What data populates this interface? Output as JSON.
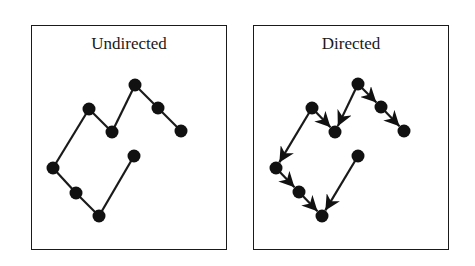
{
  "panels": [
    {
      "title": "Undirected",
      "directed": false,
      "nodes": [
        [
          53,
          168
        ],
        [
          76,
          193
        ],
        [
          99,
          216
        ],
        [
          134,
          156
        ],
        [
          89,
          109
        ],
        [
          112,
          132
        ],
        [
          135,
          85
        ],
        [
          158,
          108
        ],
        [
          181,
          131
        ]
      ],
      "edges": [
        [
          0,
          1
        ],
        [
          1,
          2
        ],
        [
          2,
          3
        ],
        [
          0,
          4
        ],
        [
          4,
          5
        ],
        [
          5,
          6
        ],
        [
          6,
          7
        ],
        [
          7,
          8
        ]
      ]
    },
    {
      "title": "Directed",
      "directed": true,
      "nodes": [
        [
          276,
          168
        ],
        [
          299,
          192
        ],
        [
          322,
          216
        ],
        [
          358,
          156
        ],
        [
          312,
          108
        ],
        [
          335,
          132
        ],
        [
          358,
          84
        ],
        [
          381,
          107
        ],
        [
          404,
          131
        ]
      ],
      "edges": [
        [
          0,
          1
        ],
        [
          1,
          2
        ],
        [
          3,
          2
        ],
        [
          4,
          0
        ],
        [
          4,
          5
        ],
        [
          6,
          5
        ],
        [
          6,
          7
        ],
        [
          7,
          8
        ]
      ]
    }
  ],
  "style": {
    "stroke": "#1a1a1a",
    "node_fill": "#111111",
    "node_radius": 6.5
  }
}
